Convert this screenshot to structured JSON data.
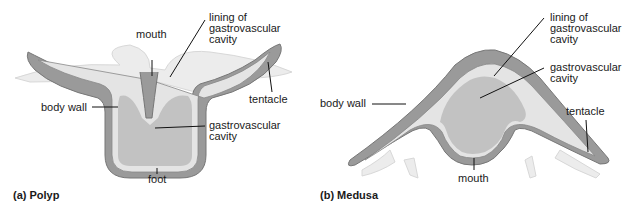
{
  "polyp": {
    "caption": "(a)  Polyp",
    "labels": {
      "mouth": "mouth",
      "lining": "lining of\ngastrovascular\ncavity",
      "body_wall": "body wall",
      "tentacle": "tentacle",
      "cavity": "gastrovascular\ncavity",
      "foot": "foot"
    }
  },
  "medusa": {
    "caption": "(b)  Medusa",
    "labels": {
      "lining": "lining of\ngastrovascular\ncavity",
      "cavity": "gastrovascular\ncavity",
      "body_wall": "body wall",
      "tentacle": "tentacle",
      "mouth": "mouth"
    }
  },
  "colors": {
    "outer_wall": "#9a9a9a",
    "inner_lining": "#e4e4e4",
    "cavity": "#c2c2c2",
    "tentacle_pale": "#ececec"
  }
}
